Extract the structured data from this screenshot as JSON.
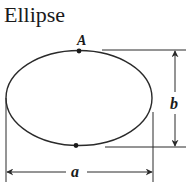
{
  "title": "Ellipse",
  "labels": {
    "point": "A",
    "width": "a",
    "height": "b"
  },
  "colors": {
    "stroke": "#2a2a2a",
    "background": "#ffffff"
  }
}
